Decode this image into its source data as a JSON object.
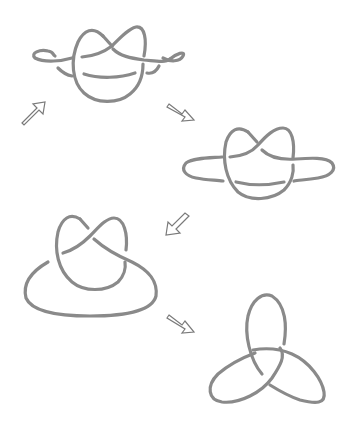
{
  "diagram": {
    "type": "knot-transformation-sequence",
    "stroke_color": "#8a8a8a",
    "arrow_outline_color": "#7a7a7a",
    "background": "#ffffff",
    "stages": [
      {
        "id": "stage-1",
        "label": "knot with two side loops (top)"
      },
      {
        "id": "stage-2",
        "label": "knot with extended horizontal loop (middle right)"
      },
      {
        "id": "stage-3",
        "label": "knot with large bottom loop (middle left)"
      },
      {
        "id": "stage-4",
        "label": "trefoil knot (bottom right)"
      }
    ],
    "arrows": [
      {
        "id": "arrow-1",
        "direction": "up-right"
      },
      {
        "id": "arrow-2",
        "direction": "down-right"
      },
      {
        "id": "arrow-3",
        "direction": "down-left"
      },
      {
        "id": "arrow-4",
        "direction": "down-right"
      }
    ]
  }
}
